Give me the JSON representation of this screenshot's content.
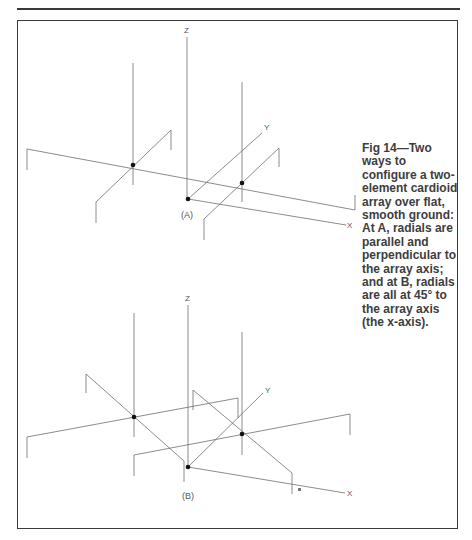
{
  "figure": {
    "number": "Fig 14",
    "title": "Fig 14—Two ways to configure a two-element cardioid array over flat, smooth ground: At A, radials are parallel and perpendicular to the array axis; and at B, radials are all at 45° to the array axis (the x-axis)."
  },
  "panels": [
    {
      "id": "A",
      "label": "(A)",
      "axes": {
        "z": "Z",
        "y": "Y",
        "x": "X"
      },
      "description": "Radials parallel and perpendicular to the array axis"
    },
    {
      "id": "B",
      "label": "(B)",
      "axes": {
        "z": "Z",
        "y": "Y",
        "x": "X"
      },
      "description": "Radials at 45° to the array axis"
    }
  ],
  "colors": {
    "line": "#6e6e6e",
    "frame": "#3a3a3a",
    "text": "#3d3d3d",
    "dot": "#111111"
  }
}
